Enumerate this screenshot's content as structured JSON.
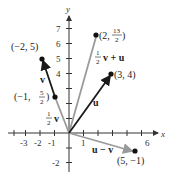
{
  "diagram": {
    "axes": {
      "x_label": "x",
      "y_label": "y",
      "x_ticks": [
        "-3",
        "-2",
        "-1",
        "1",
        "6"
      ],
      "y_ticks": [
        "7",
        "6",
        "5",
        "4",
        "-2"
      ]
    },
    "points": {
      "p1": "(−2, 5)",
      "p2_prefix": "(2, ",
      "p2_num": "13",
      "p2_den": "2",
      "p2_suffix": ")",
      "p3": "(3, 4)",
      "p4_prefix": "(−1, ",
      "p4_num": "5",
      "p4_den": "2",
      "p4_suffix": ")",
      "p5": "(5, −1)"
    },
    "vectors": {
      "v": "v",
      "u": "u",
      "half_v_num": "1",
      "half_v_den": "2",
      "half_v_name": "v",
      "half_v_plus_u_num": "1",
      "half_v_plus_u_den": "2",
      "half_v_plus_u_name": "v + u",
      "u_minus_v": "u − v"
    },
    "colors": {
      "primary_vector": "#1a1a1a",
      "secondary_vector": "#9a9a9a",
      "axis": "#333333"
    }
  }
}
